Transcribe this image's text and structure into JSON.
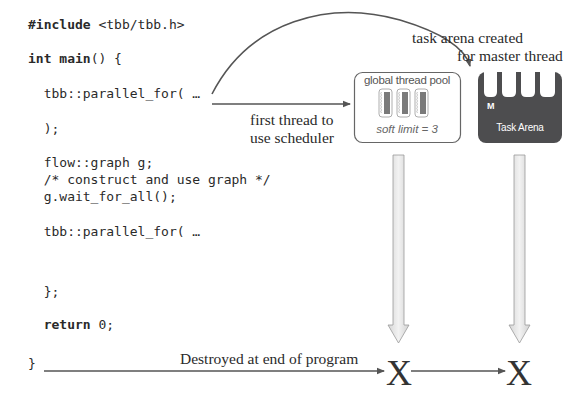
{
  "code": {
    "lines": [
      {
        "keyword": "#include",
        "text": " <tbb/tbb.h>"
      },
      {
        "keyword": "int main",
        "text": "() {"
      },
      {
        "keyword": "",
        "text": "  tbb::parallel_for( …"
      },
      {
        "keyword": "",
        "text": "  );"
      },
      {
        "keyword": "",
        "text": "  flow::graph g;"
      },
      {
        "keyword": "",
        "text": "  /* construct and use graph */"
      },
      {
        "keyword": "",
        "text": "  g.wait_for_all();"
      },
      {
        "keyword": "",
        "text": "  tbb::parallel_for( …"
      },
      {
        "keyword": "",
        "text": "  };"
      },
      {
        "keyword": "  return",
        "text": " 0;"
      },
      {
        "keyword": "",
        "text": "}"
      }
    ]
  },
  "labels": {
    "task_arena_created_line1": "task arena created",
    "task_arena_created_line2": "for master thread",
    "first_thread_line1": "first thread to",
    "first_thread_line2": "use scheduler",
    "destroyed": "Destroyed at end of program"
  },
  "global_pool": {
    "title": "global thread pool",
    "soft_limit": "soft limit = 3",
    "thread_count": 3
  },
  "task_arena": {
    "master_label": "M",
    "title": "Task Arena",
    "slots": 4,
    "color": "#4d4d4f"
  },
  "destroy_marks": [
    "X",
    "X"
  ],
  "colors": {
    "line": "#555555",
    "arena": "#4d4d4f",
    "pool_border": "#666666",
    "down_arrow_fill": "#e4e4e4",
    "down_arrow_stroke": "#9a9a9a"
  }
}
